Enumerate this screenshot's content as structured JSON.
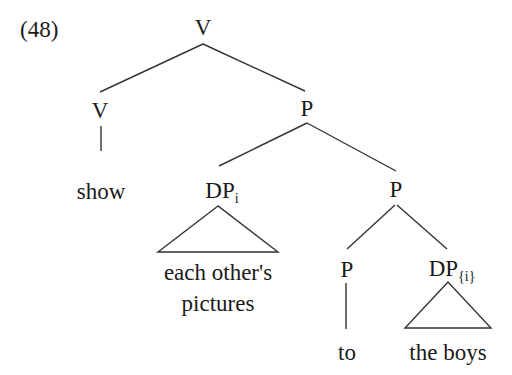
{
  "example_number": "(48)",
  "nodes": {
    "root": {
      "label": "V"
    },
    "v": {
      "label": "V"
    },
    "v_word": {
      "label": "show"
    },
    "p1": {
      "label": "P"
    },
    "dp_i": {
      "label": "DP",
      "subscript": "i"
    },
    "dp_i_text": {
      "line1": "each other's",
      "line2": "pictures"
    },
    "p2": {
      "label": "P"
    },
    "p3": {
      "label": "P"
    },
    "p3_word": {
      "label": "to"
    },
    "dp_j": {
      "label": "DP",
      "subscript": "{i}"
    },
    "dp_j_text": {
      "label": "the boys"
    }
  },
  "colors": {
    "line": "#333333",
    "text": "#1a1a1a",
    "background": "#ffffff"
  }
}
